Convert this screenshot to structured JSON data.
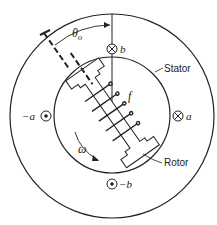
{
  "diagram": {
    "type": "synchronous machine cross-section",
    "labels": {
      "angle": "θ",
      "angle_sub": "o",
      "b": "b",
      "neg_b": "−b",
      "a": "a",
      "neg_a": "−a",
      "field": "f",
      "omega": "ω",
      "stator": "Stator",
      "rotor": "Rotor"
    },
    "colors": {
      "line": "#222222",
      "background": "#ffffff"
    }
  }
}
